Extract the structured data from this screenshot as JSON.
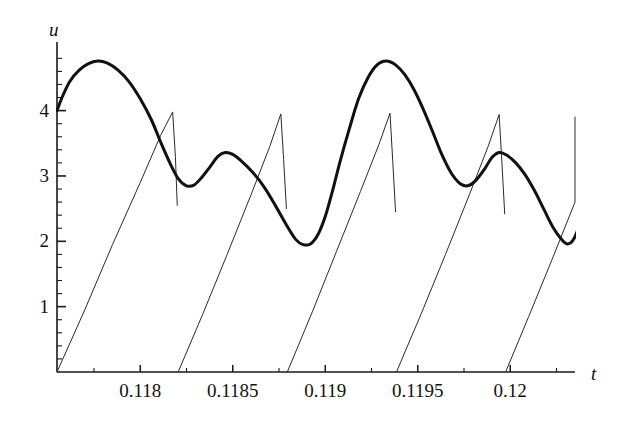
{
  "chart_data": {
    "type": "line",
    "title": "",
    "subtitle": "",
    "xlabel": "t",
    "ylabel": "u",
    "grid": false,
    "legend": "none",
    "xlim": [
      0.11755,
      0.12035
    ],
    "ylim": [
      0,
      5.05
    ],
    "x_ticks_major": [
      0.118,
      0.1185,
      0.119,
      0.1195,
      0.12
    ],
    "x_tick_labels": [
      "0.118",
      "0.1185",
      "0.119",
      "0.1195",
      "0.12"
    ],
    "x_ticks_minor": [
      0.11775,
      0.11825,
      0.11875,
      0.11925,
      0.11975,
      0.12025
    ],
    "y_ticks_major": [
      1,
      2,
      3,
      4
    ],
    "y_tick_labels": [
      "1",
      "2",
      "3",
      "4"
    ],
    "y_ticks_minor": [
      0.2,
      0.4,
      0.6,
      0.8,
      1.2,
      1.4,
      1.6,
      1.8,
      2.2,
      2.4,
      2.6,
      2.8,
      3.2,
      3.4,
      3.6,
      3.8,
      4.2,
      4.4,
      4.6,
      4.8
    ],
    "axis_color": "#1a1a1a",
    "series": [
      {
        "name": "sawtooth-thin-curve",
        "style": "thin",
        "color": "#2a2a2a",
        "width": 1,
        "description": "Relaxation / sawtooth oscillation: slow near-linear rise from 0 up to about 4, then a near-vertical reset back to 0.",
        "segments": [
          [
            [
              0.11755,
              0.0
            ],
            [
              0.1177,
              0.95
            ],
            [
              0.11785,
              1.95
            ],
            [
              0.118,
              2.9
            ],
            [
              0.11811,
              3.62
            ],
            [
              0.118175,
              3.98
            ],
            [
              0.11819,
              3.3
            ],
            [
              0.1182,
              2.55
            ]
          ],
          [
            [
              0.118205,
              0.0
            ],
            [
              0.11834,
              0.9
            ],
            [
              0.11847,
              1.8
            ],
            [
              0.1186,
              2.72
            ],
            [
              0.1187,
              3.45
            ],
            [
              0.11876,
              3.95
            ],
            [
              0.118775,
              3.25
            ],
            [
              0.11879,
              2.5
            ]
          ],
          [
            [
              0.118795,
              0.0
            ],
            [
              0.11893,
              0.92
            ],
            [
              0.11906,
              1.84
            ],
            [
              0.11919,
              2.76
            ],
            [
              0.11929,
              3.48
            ],
            [
              0.11935,
              3.96
            ],
            [
              0.119365,
              3.22
            ],
            [
              0.11938,
              2.45
            ]
          ],
          [
            [
              0.119385,
              0.0
            ],
            [
              0.11952,
              0.9
            ],
            [
              0.11965,
              1.8
            ],
            [
              0.11978,
              2.72
            ],
            [
              0.11988,
              3.45
            ],
            [
              0.11994,
              3.94
            ],
            [
              0.119955,
              3.2
            ],
            [
              0.11997,
              2.42
            ]
          ],
          [
            [
              0.119975,
              0.0
            ],
            [
              0.1201,
              0.85
            ],
            [
              0.12023,
              1.75
            ],
            [
              0.12035,
              2.6
            ],
            [
              0.12035,
              3.9
            ]
          ]
        ]
      },
      {
        "name": "bold-oscillation-curve",
        "style": "bold",
        "color": "#111111",
        "width": 3,
        "description": "Bold smooth multi-frequency oscillation starting near u = 4.0, peaking near 4.75, with minima near 2.85 and 1.95.",
        "points": [
          [
            0.11755,
            4.0
          ],
          [
            0.11758,
            4.22
          ],
          [
            0.11762,
            4.45
          ],
          [
            0.11767,
            4.62
          ],
          [
            0.11772,
            4.72
          ],
          [
            0.11777,
            4.76
          ],
          [
            0.11782,
            4.73
          ],
          [
            0.11788,
            4.62
          ],
          [
            0.11794,
            4.44
          ],
          [
            0.118,
            4.18
          ],
          [
            0.11806,
            3.86
          ],
          [
            0.11811,
            3.52
          ],
          [
            0.11816,
            3.2
          ],
          [
            0.118205,
            2.96
          ],
          [
            0.11825,
            2.85
          ],
          [
            0.11829,
            2.86
          ],
          [
            0.11833,
            2.97
          ],
          [
            0.11838,
            3.15
          ],
          [
            0.11842,
            3.3
          ],
          [
            0.11846,
            3.36
          ],
          [
            0.1185,
            3.33
          ],
          [
            0.11855,
            3.22
          ],
          [
            0.11861,
            3.05
          ],
          [
            0.11867,
            2.83
          ],
          [
            0.11873,
            2.55
          ],
          [
            0.11879,
            2.25
          ],
          [
            0.11884,
            2.03
          ],
          [
            0.11888,
            1.95
          ],
          [
            0.11892,
            1.96
          ],
          [
            0.11896,
            2.1
          ],
          [
            0.119,
            2.38
          ],
          [
            0.11904,
            2.78
          ],
          [
            0.11908,
            3.22
          ],
          [
            0.11913,
            3.72
          ],
          [
            0.11918,
            4.18
          ],
          [
            0.11923,
            4.5
          ],
          [
            0.11928,
            4.7
          ],
          [
            0.11933,
            4.76
          ],
          [
            0.11938,
            4.7
          ],
          [
            0.11943,
            4.55
          ],
          [
            0.11948,
            4.32
          ],
          [
            0.11953,
            4.02
          ],
          [
            0.11958,
            3.68
          ],
          [
            0.11963,
            3.33
          ],
          [
            0.11968,
            3.05
          ],
          [
            0.11973,
            2.88
          ],
          [
            0.11977,
            2.85
          ],
          [
            0.11981,
            2.92
          ],
          [
            0.11986,
            3.1
          ],
          [
            0.1199,
            3.28
          ],
          [
            0.11994,
            3.36
          ],
          [
            0.11998,
            3.32
          ],
          [
            0.12003,
            3.2
          ],
          [
            0.12008,
            3.02
          ],
          [
            0.12013,
            2.78
          ],
          [
            0.12018,
            2.5
          ],
          [
            0.12023,
            2.22
          ],
          [
            0.12028,
            2.02
          ],
          [
            0.12031,
            1.96
          ],
          [
            0.12034,
            2.02
          ],
          [
            0.12037,
            2.22
          ],
          [
            0.1204,
            2.55
          ],
          [
            0.12043,
            2.95
          ],
          [
            0.12046,
            3.4
          ],
          [
            0.12048,
            3.75
          ],
          [
            0.1205,
            3.92
          ]
        ]
      }
    ]
  }
}
